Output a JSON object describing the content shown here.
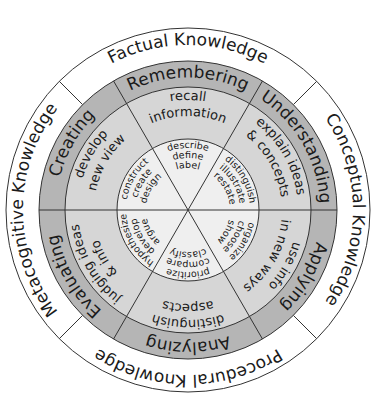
{
  "diagram": {
    "colors": {
      "knowledge_ring": "#ffffff",
      "level_ring": "#b5b5b5",
      "activity_ring": "#d6d6d6",
      "verb_core": "#efefef",
      "lines": "#333333",
      "text": "#1a1a1a"
    },
    "knowledge": [
      {
        "label": "Factual Knowledge"
      },
      {
        "label": "Conceptual Knowledge"
      },
      {
        "label": "Procedural Knowledge"
      },
      {
        "label": "Metacognitive Knowledge"
      }
    ],
    "levels": [
      {
        "label": "Remembering",
        "activity_1": "recall",
        "activity_2": "information",
        "verbs": [
          "describe",
          "define",
          "label"
        ]
      },
      {
        "label": "Understanding",
        "activity_1": "explain ideas",
        "activity_2": "& concepts",
        "verbs": [
          "distinguish",
          "illustrate",
          "restate"
        ]
      },
      {
        "label": "Applying",
        "activity_1": "use info",
        "activity_2": "in new ways",
        "verbs": [
          "organize",
          "choose",
          "show"
        ]
      },
      {
        "label": "Analyzing",
        "activity_1": "distinguish",
        "activity_2": "aspects",
        "verbs": [
          "prioritize",
          "compare",
          "classify"
        ]
      },
      {
        "label": "Evaluating",
        "activity_1": "judging ideas",
        "activity_2": "& info",
        "verbs": [
          "hypothesize",
          "develop",
          "argue"
        ]
      },
      {
        "label": "Creating",
        "activity_1": "develop",
        "activity_2": "new view",
        "verbs": [
          "construct",
          "create",
          "design"
        ]
      }
    ]
  }
}
